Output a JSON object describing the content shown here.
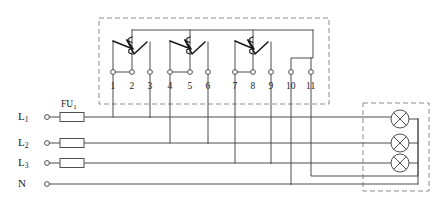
{
  "diagram": {
    "stroke_color": "#4d4d4d",
    "contact_color": "#1a1a1a",
    "dashed_color": "#8c8c8c",
    "background": "#ffffff"
  },
  "control_box": {
    "name": "switch-assembly-enclosure",
    "style": "dashed",
    "x": 99,
    "y": 18,
    "w": 230,
    "h": 86
  },
  "lamp_box": {
    "name": "lamp-enclosure",
    "style": "dashed",
    "x": 363,
    "y": 103,
    "w": 66,
    "h": 88
  },
  "terminals": [
    {
      "id": 1,
      "label": "1",
      "x": 113,
      "y": 82
    },
    {
      "id": 2,
      "label": "2",
      "x": 132,
      "y": 82
    },
    {
      "id": 3,
      "label": "3",
      "x": 150,
      "y": 82
    },
    {
      "id": 4,
      "label": "4",
      "x": 170,
      "y": 82
    },
    {
      "id": 5,
      "label": "5",
      "x": 190,
      "y": 82
    },
    {
      "id": 6,
      "label": "6",
      "x": 208,
      "y": 82
    },
    {
      "id": 7,
      "label": "7",
      "x": 235,
      "y": 82
    },
    {
      "id": 8,
      "label": "8",
      "x": 253,
      "y": 82
    },
    {
      "id": 9,
      "label": "9",
      "x": 271,
      "y": 82
    },
    {
      "id": 10,
      "label": "10",
      "x": 291,
      "y": 82
    },
    {
      "id": 11,
      "label": "11",
      "x": 311,
      "y": 82
    }
  ],
  "switches": [
    {
      "name": "changeover-switch-1",
      "coil_x": 132,
      "left_x": 113,
      "right_x": 150
    },
    {
      "name": "changeover-switch-2",
      "coil_x": 190,
      "left_x": 170,
      "right_x": 208
    },
    {
      "name": "changeover-switch-3",
      "coil_x": 253,
      "left_x": 235,
      "right_x": 271
    }
  ],
  "supply_lines": [
    {
      "name": "line-L1",
      "label": "L",
      "sub": "1",
      "y": 117,
      "fused": true,
      "fuse_name": "fuse-FU1"
    },
    {
      "name": "line-L2",
      "label": "L",
      "sub": "2",
      "y": 143,
      "fused": true,
      "fuse_name": "fuse-FU2"
    },
    {
      "name": "line-L3",
      "label": "L",
      "sub": "3",
      "y": 163,
      "fused": true,
      "fuse_name": "fuse-FU3"
    },
    {
      "name": "line-N",
      "label": "N",
      "sub": "",
      "y": 184,
      "fused": false,
      "fuse_name": ""
    }
  ],
  "fuse_label": {
    "text": "FU",
    "sub": "1",
    "x": 61,
    "y": 100
  },
  "lamps": [
    {
      "name": "lamp-1",
      "cx": 400,
      "cy": 119,
      "r": 9
    },
    {
      "name": "lamp-2",
      "cx": 400,
      "cy": 143,
      "r": 9
    },
    {
      "name": "lamp-3",
      "cx": 400,
      "cy": 163,
      "r": 9
    }
  ],
  "neutral_bus": {
    "name": "lamp-neutral-bus",
    "x": 418,
    "y_top": 119,
    "y_bottom": 184
  },
  "drop_wires": [
    {
      "name": "drop-terminal-1-to-L1",
      "from_terminal": 1,
      "to_line": "L1"
    },
    {
      "name": "drop-terminal-3-to-L1",
      "from_terminal": 3,
      "to_line": "L1"
    },
    {
      "name": "drop-terminal-4-to-L2",
      "from_terminal": 4,
      "to_line": "L2"
    },
    {
      "name": "drop-terminal-6-to-L2",
      "from_terminal": 6,
      "to_line": "L2"
    },
    {
      "name": "drop-terminal-7-to-L3",
      "from_terminal": 7,
      "to_line": "L3"
    },
    {
      "name": "drop-terminal-9-to-L3",
      "from_terminal": 9,
      "to_line": "L3"
    },
    {
      "name": "drop-terminal-10-to-N",
      "from_terminal": 10,
      "to_line": "N"
    },
    {
      "name": "drop-terminal-11-to-lamp-bus",
      "from_terminal": 11,
      "to_line": "lamp-bus"
    }
  ]
}
